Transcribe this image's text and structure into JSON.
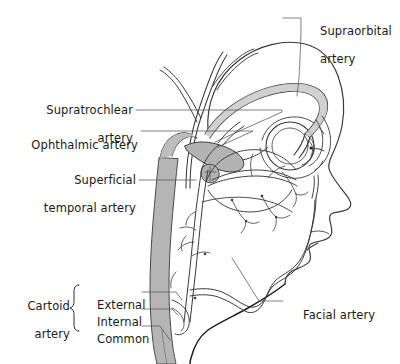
{
  "figure": {
    "type": "anatomical-diagram",
    "width": 400,
    "height": 364,
    "background_color": "#ffffff",
    "line_color": "#3a3a3a",
    "vessel_fill_color": "#b9b9b9",
    "text_color": "#1a1a1a"
  },
  "labels": {
    "supraorbital": {
      "line1": "Supraorbital",
      "line2": "artery"
    },
    "supratrochlear": {
      "line1": "Supratrochlear",
      "line2": "artery"
    },
    "ophthalmic": {
      "line1": "Ophthalmic artery"
    },
    "superficial_temporal": {
      "line1": "Superficial",
      "line2": "temporal artery"
    },
    "facial": {
      "line1": "Facial artery"
    },
    "carotid_group": {
      "line1": "Cartoid",
      "line2": "artery",
      "branches": [
        {
          "label": "External"
        },
        {
          "label": "Internal"
        },
        {
          "label": "Common"
        }
      ]
    }
  }
}
